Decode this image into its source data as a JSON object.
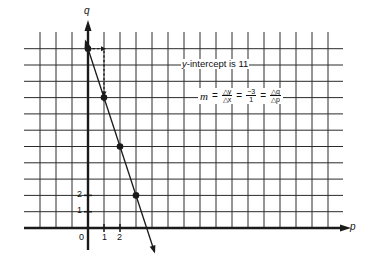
{
  "chart_data": {
    "type": "line",
    "title": "",
    "xlabel": "p",
    "ylabel": "q",
    "x_ticks_labeled": [
      "0",
      "1",
      "2"
    ],
    "y_ticks_labeled": [
      "1",
      "2"
    ],
    "xlim": [
      -4,
      15
    ],
    "ylim": [
      0,
      11.5
    ],
    "grid": true,
    "series": [
      {
        "name": "q = 11 - 3p",
        "x": [
          0,
          1,
          2,
          3
        ],
        "y": [
          11,
          8,
          5,
          2
        ],
        "markers": true
      }
    ],
    "slope_run_rise": {
      "from": [
        0,
        11
      ],
      "corner": [
        1,
        11
      ],
      "to": [
        1,
        8
      ],
      "style": "dashed"
    },
    "annotations": [
      {
        "text": "y-intercept is 11"
      },
      {
        "text": "m = Δy/Δx = -3/1 = Δq/Δp"
      }
    ]
  },
  "axes": {
    "x_name": "p",
    "y_name": "q",
    "origin_label": "0",
    "x_tick_labels": [
      "1",
      "2"
    ],
    "y_tick_labels": [
      "1",
      "2"
    ]
  },
  "annotation": {
    "intercept_text": "y-intercept is 11",
    "intercept_prefix_italic": "y",
    "intercept_rest": "-intercept is 11"
  },
  "formula": {
    "m": "m",
    "eq": "=",
    "f1_num": "△y",
    "f1_den": "△x",
    "f2_num": "−3",
    "f2_den": "1",
    "f3_num": "△q",
    "f3_den": "△p"
  },
  "colors": {
    "ink": "#1a1a1a",
    "grid": "#2a2a2a",
    "background": "#ffffff"
  }
}
